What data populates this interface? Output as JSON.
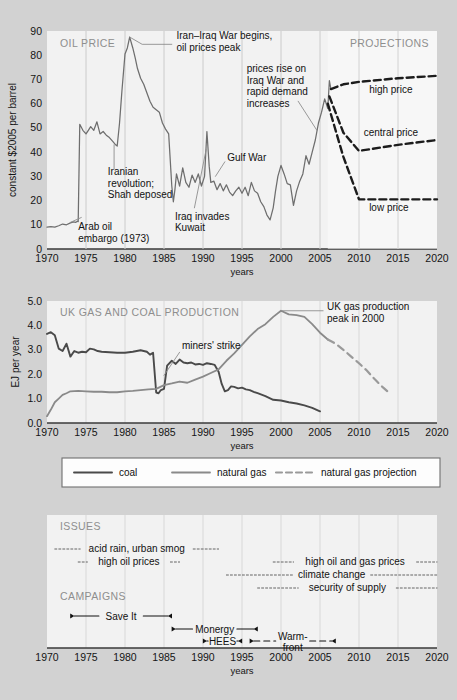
{
  "figure": {
    "background_color": "#d2d2d2",
    "panel_fill": "#f2f2f2",
    "gridline_color": "#d8d8d8",
    "coal_color": "#4a4a4a",
    "gas_color": "#8a8a8a",
    "projection_color": "#9a9a9a",
    "oil_color": "#6e6e6e",
    "dash_color": "#1c1c1c"
  },
  "xaxis": {
    "label": "years",
    "ticks": [
      "1970",
      "1975",
      "1980",
      "1985",
      "1990",
      "1995",
      "2000",
      "2005",
      "2010",
      "2015",
      "2020"
    ],
    "min": 1970,
    "max": 2020
  },
  "panel1": {
    "title": "OIL PRICE",
    "title_right": "PROJECTIONS",
    "ylabel": "constant $2005 per barrel",
    "yticks": [
      "0",
      "10",
      "20",
      "30",
      "40",
      "50",
      "60",
      "70",
      "80",
      "90"
    ],
    "ymin": 0,
    "ymax": 90,
    "annotations": [
      {
        "name": "arab-oil-embargo",
        "text": "Arab oil\nembargo (1973)"
      },
      {
        "name": "iranian-revolution",
        "text": "Iranian\nrevolution;\nShah deposed"
      },
      {
        "name": "iran-iraq-war",
        "text": "Iran–Iraq War begins,\noil prices peak"
      },
      {
        "name": "iraq-invades-kuwait",
        "text": "Iraq invades\nKuwait"
      },
      {
        "name": "gulf-war",
        "text": "Gulf War"
      },
      {
        "name": "prices-rise-iraq-war",
        "text": "prices rise on\nIraq War and\nrapid demand\nincreases"
      },
      {
        "name": "high-price",
        "text": "high price"
      },
      {
        "name": "central-price",
        "text": "central price"
      },
      {
        "name": "low-price",
        "text": "low price"
      }
    ]
  },
  "panel2": {
    "title": "UK GAS AND COAL PRODUCTION",
    "ylabel": "EJ per year",
    "yticks": [
      "0.0",
      "1.0",
      "2.0",
      "3.0",
      "4.0",
      "5.0"
    ],
    "ymin": 0,
    "ymax": 5,
    "annotations": [
      {
        "name": "miners-strike",
        "text": "miners' strike"
      },
      {
        "name": "uk-gas-peak",
        "text": "UK gas production\npeak in 2000"
      }
    ]
  },
  "legend": {
    "items": [
      {
        "label": "coal",
        "style": "solid-dark"
      },
      {
        "label": "natural gas",
        "style": "solid-gray"
      },
      {
        "label": "natural gas projection",
        "style": "dashed-gray"
      }
    ]
  },
  "panel3": {
    "title_issues": "ISSUES",
    "title_campaigns": "CAMPAIGNS",
    "issues": [
      {
        "name": "acid-rain-urban-smog",
        "label": "acid rain, urban smog",
        "start": 1971,
        "end": 1992
      },
      {
        "name": "high-oil-prices",
        "label": "high oil prices",
        "start": 1974,
        "end": 1987
      },
      {
        "name": "high-oil-and-gas-prices",
        "label": "high oil and gas prices",
        "start": 1999,
        "end": 2020
      },
      {
        "name": "climate-change",
        "label": "climate change",
        "start": 1993,
        "end": 2020
      },
      {
        "name": "security-of-supply",
        "label": "security of supply",
        "start": 1997,
        "end": 2020
      }
    ],
    "campaigns": [
      {
        "name": "save-it",
        "label": "Save It",
        "start": 1973,
        "end": 1986
      },
      {
        "name": "monergy",
        "label": "Monergy",
        "start": 1986,
        "end": 1997
      },
      {
        "name": "hees",
        "label": "HEES",
        "start": 1990,
        "end": 1995
      },
      {
        "name": "warm-front",
        "label": "Warm-\nfront",
        "start": 1996,
        "end": 2007
      }
    ]
  },
  "chart_data": [
    {
      "type": "line",
      "name": "oil-price",
      "title": "OIL PRICE",
      "xlabel": "years",
      "ylabel": "constant $2005 per barrel",
      "xlim": [
        1970,
        2020
      ],
      "ylim": [
        0,
        90
      ],
      "grid": "vertical",
      "projection_boundary": 2006,
      "series": [
        {
          "name": "oil price (historic)",
          "style": "solid",
          "x": [
            1970.0,
            1970.5,
            1971.0,
            1971.5,
            1972.0,
            1972.5,
            1973.0,
            1973.4,
            1973.7,
            1973.9,
            1974.0,
            1974.2,
            1974.6,
            1975.0,
            1975.3,
            1975.6,
            1976.0,
            1976.4,
            1976.8,
            1977.2,
            1977.6,
            1978.0,
            1978.4,
            1978.8,
            1979.0,
            1979.3,
            1979.6,
            1980.0,
            1980.3,
            1980.6,
            1981.0,
            1981.3,
            1981.6,
            1982.0,
            1982.4,
            1982.8,
            1983.2,
            1983.6,
            1984.0,
            1984.4,
            1984.8,
            1985.2,
            1985.6,
            1986.0,
            1986.2,
            1986.4,
            1986.6,
            1987.0,
            1987.4,
            1987.8,
            1988.2,
            1988.6,
            1989.0,
            1989.4,
            1989.8,
            1990.2,
            1990.5,
            1990.8,
            1991.0,
            1991.4,
            1991.8,
            1992.2,
            1992.6,
            1993.0,
            1993.4,
            1993.8,
            1994.2,
            1994.6,
            1995.0,
            1995.4,
            1995.8,
            1996.2,
            1996.6,
            1997.0,
            1997.4,
            1997.8,
            1998.2,
            1998.6,
            1999.0,
            1999.3,
            1999.6,
            2000.0,
            2000.4,
            2000.8,
            2001.2,
            2001.6,
            2002.0,
            2002.4,
            2002.8,
            2003.2,
            2003.6,
            2004.0,
            2004.4,
            2004.8,
            2005.2,
            2005.6,
            2006.0,
            2006.2,
            2006.4
          ],
          "y": [
            9,
            9.2,
            9.0,
            9.6,
            10.3,
            10.0,
            10.8,
            11.2,
            11.0,
            11.5,
            11.3,
            51.5,
            49.0,
            47.5,
            49.0,
            50.5,
            49.0,
            52.5,
            47.5,
            48.5,
            47.0,
            46.0,
            44.5,
            43.0,
            42.5,
            52.0,
            65.0,
            80.5,
            83.0,
            87.5,
            83.0,
            79.0,
            74.5,
            70.5,
            68.0,
            64.5,
            61.0,
            58.5,
            57.5,
            56.5,
            52.0,
            49.5,
            47.5,
            26.0,
            19.5,
            24.5,
            31.0,
            26.0,
            33.5,
            27.5,
            25.5,
            30.5,
            27.5,
            31.0,
            26.0,
            30.0,
            48.5,
            34.0,
            27.5,
            28.0,
            24.5,
            27.0,
            24.0,
            26.5,
            23.5,
            22.0,
            24.0,
            25.5,
            23.0,
            25.5,
            22.0,
            27.5,
            24.0,
            23.0,
            19.5,
            17.5,
            14.0,
            12.0,
            17.0,
            24.0,
            30.0,
            34.5,
            31.0,
            27.0,
            26.5,
            18.0,
            24.0,
            28.0,
            31.0,
            38.5,
            35.0,
            40.0,
            45.0,
            52.0,
            56.5,
            62.0,
            58.0,
            69.5,
            66.0
          ]
        },
        {
          "name": "high price projection",
          "style": "dashed",
          "x": [
            2006.4,
            2008.0,
            2010.0,
            2015.0,
            2020.0
          ],
          "y": [
            66.0,
            68.0,
            69.0,
            70.5,
            71.5
          ]
        },
        {
          "name": "central price projection",
          "style": "dashed",
          "x": [
            2006.2,
            2008.0,
            2010.0,
            2015.0,
            2020.0
          ],
          "y": [
            63.0,
            48.0,
            40.5,
            43.0,
            45.0
          ]
        },
        {
          "name": "low price projection",
          "style": "dashed",
          "x": [
            2006.0,
            2008.0,
            2010.0,
            2015.0,
            2020.0
          ],
          "y": [
            60.0,
            38.0,
            20.5,
            20.5,
            20.5
          ]
        }
      ]
    },
    {
      "type": "line",
      "name": "uk-gas-and-coal-production",
      "title": "UK GAS AND COAL PRODUCTION",
      "xlabel": "years",
      "ylabel": "EJ per year",
      "xlim": [
        1970,
        2020
      ],
      "ylim": [
        0,
        5
      ],
      "grid": "vertical",
      "series": [
        {
          "name": "coal",
          "style": "solid-dark",
          "x": [
            1970,
            1970.5,
            1971,
            1971.5,
            1972,
            1972.5,
            1973,
            1973.5,
            1974,
            1974.5,
            1975,
            1975.5,
            1976,
            1976.5,
            1977,
            1978,
            1979,
            1980,
            1981,
            1982,
            1982.8,
            1983.2,
            1983.6,
            1984,
            1984.3,
            1984.6,
            1985,
            1985.4,
            1986,
            1986.5,
            1987,
            1987.5,
            1988,
            1988.5,
            1989,
            1989.5,
            1990,
            1990.5,
            1991,
            1991.5,
            1992,
            1992.4,
            1992.8,
            1993.2,
            1993.6,
            1994,
            1994.5,
            1995,
            1995.5,
            1996,
            1996.5,
            1997,
            1998,
            1999,
            2000,
            2001,
            2002,
            2003,
            2004,
            2005
          ],
          "y": [
            3.65,
            3.72,
            3.6,
            3.05,
            2.95,
            3.25,
            2.72,
            2.95,
            2.88,
            2.92,
            2.9,
            3.05,
            3.02,
            2.95,
            2.92,
            2.9,
            2.88,
            2.88,
            2.92,
            2.98,
            2.92,
            2.8,
            2.88,
            1.25,
            1.22,
            1.35,
            1.4,
            2.35,
            2.55,
            2.42,
            2.6,
            2.48,
            2.45,
            2.48,
            2.4,
            2.42,
            2.38,
            2.45,
            2.42,
            2.38,
            2.1,
            1.6,
            1.3,
            1.35,
            1.5,
            1.48,
            1.42,
            1.45,
            1.38,
            1.35,
            1.28,
            1.22,
            1.1,
            0.95,
            0.92,
            0.85,
            0.8,
            0.72,
            0.62,
            0.48
          ]
        },
        {
          "name": "natural gas",
          "style": "solid-gray",
          "x": [
            1970,
            1970.5,
            1971,
            1971.5,
            1972,
            1972.5,
            1973,
            1974,
            1975,
            1976,
            1977,
            1978,
            1979,
            1980,
            1981,
            1982,
            1983,
            1984,
            1985,
            1986,
            1987,
            1988,
            1989,
            1990,
            1991,
            1992,
            1993,
            1994,
            1995,
            1996,
            1997,
            1998,
            1999,
            2000,
            2001,
            2002,
            2003,
            2004,
            2005,
            2006
          ],
          "y": [
            0.28,
            0.55,
            0.85,
            1.0,
            1.15,
            1.22,
            1.3,
            1.32,
            1.3,
            1.28,
            1.28,
            1.26,
            1.26,
            1.3,
            1.32,
            1.35,
            1.38,
            1.4,
            1.55,
            1.62,
            1.7,
            1.65,
            1.78,
            1.9,
            2.05,
            2.2,
            2.55,
            2.85,
            3.2,
            3.55,
            3.85,
            4.05,
            4.35,
            4.6,
            4.45,
            4.42,
            4.35,
            4.05,
            3.7,
            3.42
          ]
        },
        {
          "name": "natural gas projection",
          "style": "dashed-gray",
          "x": [
            2006,
            2007,
            2008,
            2009,
            2010,
            2011,
            2012,
            2013,
            2014
          ],
          "y": [
            3.42,
            3.25,
            3.0,
            2.72,
            2.45,
            2.15,
            1.8,
            1.48,
            1.2
          ]
        }
      ]
    }
  ]
}
